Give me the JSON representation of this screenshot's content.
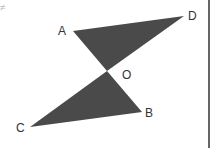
{
  "figure": {
    "type": "geometry",
    "fill_color": "#4a4a4a",
    "border_color": "#333333",
    "corner_artifact": "≠",
    "points": {
      "A": {
        "label": "A",
        "x": 73,
        "y": 31
      },
      "D": {
        "label": "D",
        "x": 184,
        "y": 16
      },
      "O": {
        "label": "O",
        "x": 107,
        "y": 71
      },
      "B": {
        "label": "B",
        "x": 142,
        "y": 112
      },
      "C": {
        "label": "C",
        "x": 30,
        "y": 127
      }
    },
    "triangles": [
      {
        "name": "AOD",
        "vertices": [
          "A",
          "O",
          "D"
        ]
      },
      {
        "name": "BOC",
        "vertices": [
          "B",
          "O",
          "C"
        ]
      }
    ]
  }
}
